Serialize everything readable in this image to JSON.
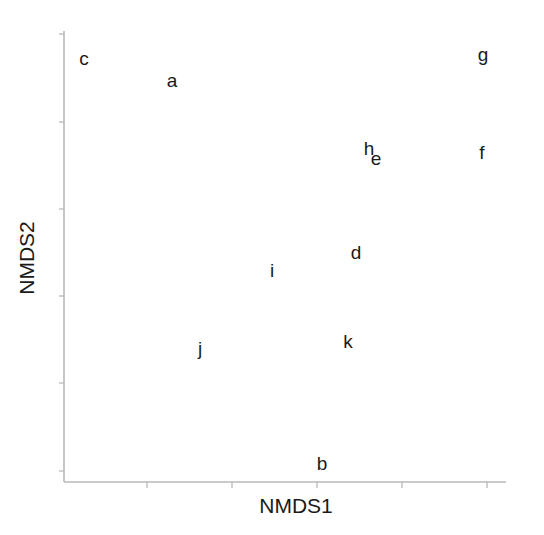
{
  "chart_data": {
    "type": "scatter",
    "title": "",
    "xlabel": "NMDS1",
    "ylabel": "NMDS2",
    "marker": "text-labels",
    "grid": false,
    "legend": null,
    "x_ticks_count": 5,
    "y_ticks_count": 6,
    "tick_labels_shown": false,
    "note": "Coordinates expressed in tick units: x tick positions 1..5, y tick positions 0..5 (bottom to top); no numeric tick labels are shown.",
    "points": [
      {
        "label": "c",
        "x": -0.0,
        "y": 5.2
      },
      {
        "label": "a",
        "x": 1.3,
        "y": 4.47
      },
      {
        "label": "g",
        "x": 4.97,
        "y": 4.62
      },
      {
        "label": "h",
        "x": 3.58,
        "y": 3.69
      },
      {
        "label": "e",
        "x": 3.67,
        "y": 3.59
      },
      {
        "label": "f",
        "x": 4.95,
        "y": 3.66
      },
      {
        "label": "d",
        "x": 3.45,
        "y": 2.5
      },
      {
        "label": "i",
        "x": 2.47,
        "y": 2.3
      },
      {
        "label": "j",
        "x": 1.62,
        "y": 1.41
      },
      {
        "label": "k",
        "x": 3.36,
        "y": 1.49
      },
      {
        "label": "b",
        "x": 3.06,
        "y": 0.1
      }
    ]
  },
  "axes": {
    "x_title": "NMDS1",
    "y_title": "NMDS2",
    "color": "#b8b8b8"
  },
  "layout": {
    "x_axis_y": 482,
    "y_axis_x": 64,
    "x_ticks_px": [
      147,
      232,
      317,
      402,
      487
    ],
    "y_ticks_px": [
      34,
      122,
      209,
      296,
      383,
      471
    ],
    "label_px": {
      "c": [
        84,
        58
      ],
      "a": [
        172,
        80
      ],
      "g": [
        483,
        54
      ],
      "h": [
        369,
        148
      ],
      "e": [
        376,
        158
      ],
      "f": [
        482,
        152
      ],
      "d": [
        356,
        252
      ],
      "i": [
        272,
        270
      ],
      "j": [
        200,
        348
      ],
      "k": [
        348,
        341
      ],
      "b": [
        322,
        463
      ]
    }
  }
}
